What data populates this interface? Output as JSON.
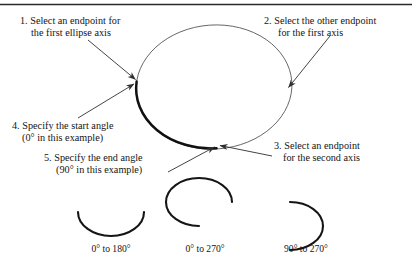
{
  "figure": {
    "ink_color": "#1a1a1a",
    "background": "#ffffff",
    "top_rule": true
  },
  "steps": [
    {
      "id": "step-1",
      "number": "1.",
      "line1": "1. Select an endpoint for",
      "line2": "the first ellipse axis",
      "target": "left-axis-endpoint"
    },
    {
      "id": "step-2",
      "number": "2.",
      "line1": "2. Select the other endpoint",
      "line2": "for the first axis",
      "target": "right-axis-endpoint"
    },
    {
      "id": "step-3",
      "number": "3.",
      "line1": "3. Select an endpoint",
      "line2": "for the second axis",
      "target": "bottom-axis-endpoint"
    },
    {
      "id": "step-4",
      "number": "4.",
      "line1": "4. Specify the start angle",
      "line2": "(0° in this example)",
      "target": "left-axis-endpoint"
    },
    {
      "id": "step-5",
      "number": "5.",
      "line1": "5. Specify the end angle",
      "line2": "(90° in this example)",
      "target": "bottom-axis-endpoint"
    }
  ],
  "examples": {
    "caption_note": "Arc sweep examples",
    "items": [
      {
        "id": "arc-0-180",
        "label": "0° to 180°",
        "start_angle": 0,
        "end_angle": 180
      },
      {
        "id": "arc-0-270",
        "label": "0° to 270°",
        "start_angle": 0,
        "end_angle": 270
      },
      {
        "id": "arc-90-270",
        "label": "90° to 270°",
        "start_angle": 90,
        "end_angle": 270
      }
    ]
  },
  "main_ellipse": {
    "id": "main-ellipse",
    "highlighted_arc": "0° to 90°",
    "highlight_weight": "bold",
    "outline_weight": "thin"
  }
}
